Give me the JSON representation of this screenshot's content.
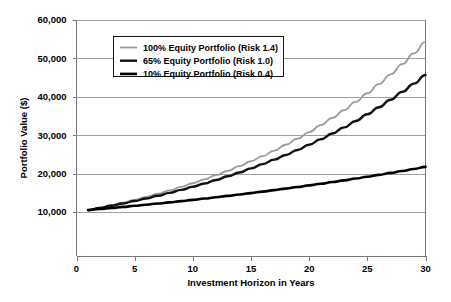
{
  "chart_data": {
    "type": "line",
    "title": "",
    "xlabel": "Investment Horizon in Years",
    "ylabel": "Portfolio Value ($)",
    "xlim": [
      0,
      30
    ],
    "ylim": [
      10000,
      60000
    ],
    "y_axis_extends_below_min": true,
    "grid": true,
    "grid_axis": "y",
    "legend_position": "upper-left-inside",
    "xticks": [
      0,
      5,
      10,
      15,
      20,
      25,
      30
    ],
    "xtick_labels": [
      "0",
      "5",
      "10",
      "15",
      "20",
      "25",
      "30"
    ],
    "yticks": [
      10000,
      20000,
      30000,
      40000,
      50000,
      60000
    ],
    "ytick_labels": [
      "10,000",
      "20,000",
      "30,000",
      "40,000",
      "50,000",
      "60,000"
    ],
    "x": [
      1,
      2,
      3,
      4,
      5,
      6,
      7,
      8,
      9,
      10,
      11,
      12,
      13,
      14,
      15,
      16,
      17,
      18,
      19,
      20,
      21,
      22,
      23,
      24,
      25,
      26,
      27,
      28,
      29,
      30
    ],
    "series": [
      {
        "name": "100% Equity Portfolio (Risk 1.4)",
        "color": "#9a9a9a",
        "width": 1.8,
        "values": [
          10500,
          11112,
          11760,
          12446,
          13171,
          13939,
          14752,
          15612,
          16522,
          17485,
          18505,
          19584,
          20726,
          21935,
          23214,
          24568,
          26000,
          27517,
          29122,
          30820,
          32618,
          34520,
          36533,
          38663,
          40918,
          43304,
          45830,
          48503,
          51332,
          54326
        ],
        "end_value_label": "54,326"
      },
      {
        "name": "65% Equity Portfolio (Risk 1.0)",
        "color": "#111111",
        "width": 2.4,
        "values": [
          10500,
          11046,
          11620,
          12225,
          12860,
          13529,
          14233,
          14973,
          15752,
          16571,
          17433,
          18340,
          19294,
          20297,
          21353,
          22464,
          23632,
          24861,
          26154,
          27514,
          28945,
          30451,
          32035,
          33701,
          35454,
          37298,
          39238,
          41280,
          43427,
          45686
        ],
        "end_value_label": "42,800"
      },
      {
        "name": "10% Equity Portfolio (Risk 0.4)",
        "color": "#000000",
        "width": 2.6,
        "values": [
          10500,
          10767,
          11041,
          11322,
          11610,
          11905,
          12208,
          12519,
          12837,
          13164,
          13499,
          13842,
          14194,
          14555,
          14926,
          15305,
          15695,
          16094,
          16503,
          16923,
          17354,
          17795,
          18248,
          18712,
          19188,
          19676,
          20177,
          20690,
          21217,
          21757
        ],
        "end_value_label": "22,000"
      }
    ],
    "legend_entries": [
      {
        "label": "100% Equity Portfolio (Risk 1.4)",
        "color": "#9a9a9a",
        "width": 1.8
      },
      {
        "label": "65% Equity Portfolio (Risk 1.0)",
        "color": "#111111",
        "width": 2.4
      },
      {
        "label": "10% Equity Portfolio (Risk 0.4)",
        "color": "#000000",
        "width": 2.6
      }
    ]
  },
  "axes": {
    "y_title": "Portfolio Value ($)",
    "x_title": "Investment Horizon in Years"
  },
  "colors": {
    "background": "#ffffff",
    "grid": "#888888",
    "axis": "#777777",
    "series_light": "#9a9a9a",
    "series_dark": "#000000"
  }
}
